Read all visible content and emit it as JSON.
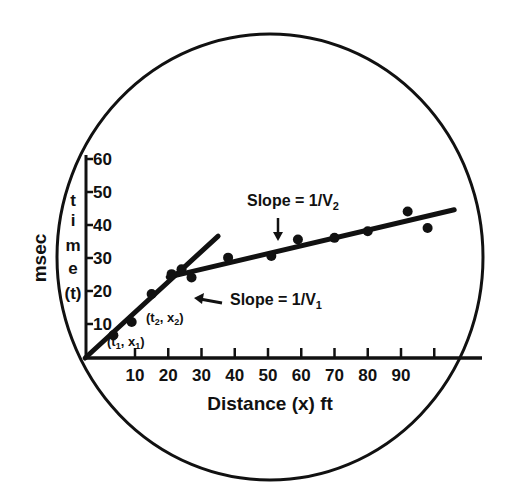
{
  "chart_data": {
    "type": "scatter",
    "title": "",
    "xlabel": "Distance (x) ft",
    "ylabel_outer": "msec",
    "ylabel_inner": [
      "t",
      "i",
      "m",
      "e",
      "(t)"
    ],
    "x_ticks": [
      10,
      20,
      30,
      40,
      50,
      60,
      70,
      80,
      90
    ],
    "x_tick_labels": [
      "10",
      "20",
      "30",
      "40",
      "50",
      "60",
      "70",
      "80",
      "90"
    ],
    "x_tick_positions_extra": [
      100
    ],
    "y_ticks": [
      10,
      20,
      30,
      40,
      50,
      60
    ],
    "y_tick_labels": [
      "10",
      "20",
      "30",
      "40",
      "50",
      "60"
    ],
    "xlim": [
      -5,
      105
    ],
    "ylim": [
      0,
      60
    ],
    "grid": false,
    "legend": null,
    "series": [
      {
        "name": "Direct wave (V1)",
        "points": [
          [
            3.5,
            6
          ],
          [
            9,
            10
          ],
          [
            15,
            18.5
          ],
          [
            21,
            24.5
          ],
          [
            24,
            26
          ]
        ],
        "fit_line": {
          "from": [
            -5,
            0
          ],
          "to": [
            35,
            36
          ]
        }
      },
      {
        "name": "Refracted wave (V2)",
        "points": [
          [
            27,
            23.5
          ],
          [
            38,
            29.5
          ],
          [
            51,
            30
          ],
          [
            59,
            35
          ],
          [
            70,
            35.5
          ],
          [
            80,
            37.5
          ],
          [
            92,
            43.5
          ],
          [
            98,
            38.5
          ]
        ],
        "fit_line": {
          "from": [
            20,
            24.5
          ],
          "to": [
            106,
            44
          ]
        }
      }
    ],
    "annotations": [
      {
        "text": "Slope = 1/V",
        "sub": "2",
        "arrow": "down",
        "at": [
          50,
          38
        ]
      },
      {
        "text": "Slope = 1/V",
        "sub": "1",
        "arrow": "left",
        "at": [
          33,
          18
        ]
      },
      {
        "text": "(t",
        "sub": "1",
        "rest": ", x",
        "sub2": "1",
        "close": ")",
        "at": [
          4,
          4
        ]
      },
      {
        "text": "(t",
        "sub": "2",
        "rest": ", x",
        "sub2": "2",
        "close": ")",
        "at": [
          16,
          11
        ]
      }
    ],
    "frame": "ellipse"
  }
}
